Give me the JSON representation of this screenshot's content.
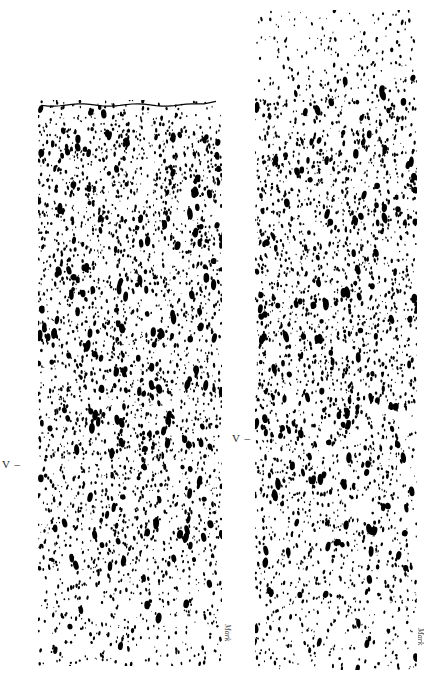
{
  "figure": {
    "background": "#ffffff",
    "ink": "#000000",
    "panels": [
      {
        "id": "left",
        "x": 38,
        "y": 100,
        "width": 184,
        "height": 566,
        "top_edge_line": true,
        "layer_marker": {
          "label": "V –",
          "x": 2,
          "y": 458
        },
        "signature": {
          "text": "Mark",
          "x": 232,
          "y": 624
        },
        "seed": 17,
        "density_profile": [
          [
            0.0,
            0.55
          ],
          [
            0.06,
            0.85
          ],
          [
            0.15,
            1.0
          ],
          [
            0.35,
            0.95
          ],
          [
            0.55,
            0.9
          ],
          [
            0.75,
            0.8
          ],
          [
            0.88,
            0.6
          ],
          [
            1.0,
            0.35
          ]
        ]
      },
      {
        "id": "right",
        "x": 255,
        "y": 10,
        "width": 162,
        "height": 660,
        "top_edge_line": false,
        "layer_marker": {
          "label": "V –",
          "x": 232,
          "y": 432
        },
        "signature": {
          "text": "Mark",
          "x": 425,
          "y": 628
        },
        "seed": 53,
        "density_profile": [
          [
            0.0,
            0.25
          ],
          [
            0.1,
            0.35
          ],
          [
            0.14,
            0.8
          ],
          [
            0.3,
            0.95
          ],
          [
            0.55,
            0.9
          ],
          [
            0.75,
            0.75
          ],
          [
            0.9,
            0.6
          ],
          [
            1.0,
            0.45
          ]
        ]
      }
    ]
  }
}
